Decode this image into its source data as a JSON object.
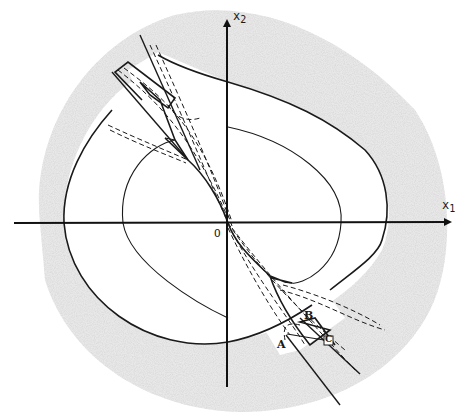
{
  "figure": {
    "type": "phase-plane sketch",
    "axes": {
      "x_label": "x",
      "x_sub": "1",
      "y_label": "x",
      "y_sub": "2",
      "origin_label": "O"
    },
    "points": {
      "A": "A",
      "B": "B",
      "C": "C"
    },
    "colors": {
      "ink": "#1a1a1a",
      "shade": "#8a8a8a",
      "paper": "#ffffff"
    }
  }
}
